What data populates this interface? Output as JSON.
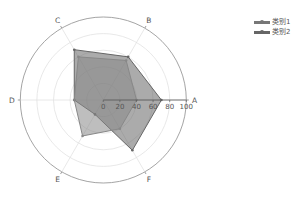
{
  "chart_data": {
    "type": "radar",
    "title": "",
    "categories": [
      "A",
      "B",
      "C",
      "D",
      "E",
      "F"
    ],
    "radial_axis": {
      "min": 0,
      "max": 100,
      "ticks": [
        0,
        20,
        40,
        60,
        80,
        100
      ],
      "tick_labels": [
        "0",
        "20",
        "40",
        "60",
        "80",
        "100"
      ]
    },
    "grid": true,
    "legend_position": "upper right",
    "series": [
      {
        "name": "类别1",
        "values": [
          70,
          60,
          70,
          35,
          20,
          70
        ],
        "color": "#666666"
      },
      {
        "name": "类别2",
        "values": [
          40,
          55,
          60,
          35,
          50,
          40
        ],
        "color": "#888888"
      }
    ]
  },
  "legend": {
    "items": [
      {
        "label": "类别1",
        "color": "#777777"
      },
      {
        "label": "类别2",
        "color": "#666666"
      }
    ]
  }
}
